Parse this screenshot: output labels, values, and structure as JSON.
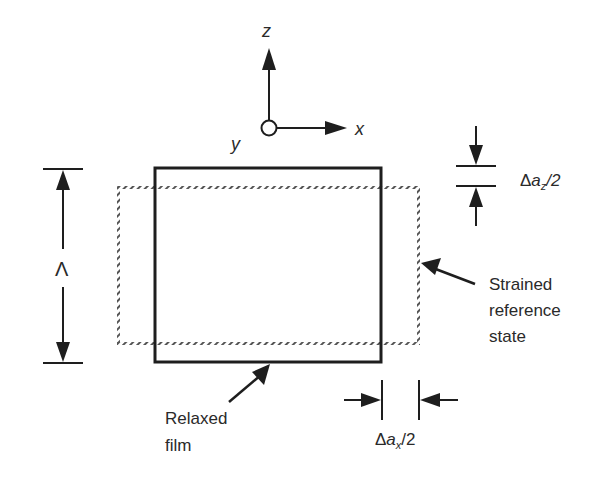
{
  "diagram": {
    "axes": {
      "z_label": "z",
      "x_label": "x",
      "y_label": "y"
    },
    "lambda_label": "Λ",
    "delta_az": {
      "delta": "Δ",
      "a": "a",
      "sub": "z",
      "tail": "/2"
    },
    "delta_ax": {
      "delta": "Δ",
      "a": "a",
      "sub": "x",
      "tail": "/2"
    },
    "strained_label": [
      "Strained",
      "reference",
      "state"
    ],
    "relaxed_label": [
      "Relaxed",
      "film"
    ],
    "colors": {
      "ink": "#1e1e1e",
      "hatch": "#555555",
      "background": "#ffffff"
    }
  }
}
